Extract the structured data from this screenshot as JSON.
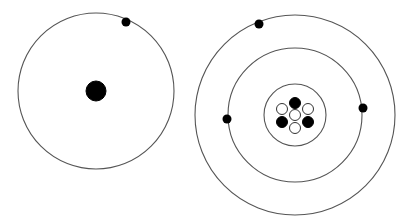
{
  "diagram": {
    "type": "bohr-atom-models",
    "colors": {
      "background": "#ffffff",
      "orbit": "#555555",
      "filled_particle": "#000000",
      "empty_particle": "#ffffff"
    },
    "atoms": [
      {
        "name": "hydrogen-like atom",
        "center": [
          96,
          91
        ],
        "nucleus": {
          "radius": 10,
          "particles": [
            {
              "type": "proton",
              "dx": 0,
              "dy": 0,
              "r": 10
            }
          ]
        },
        "orbits": [
          {
            "radius": 78
          }
        ],
        "electrons": [
          {
            "x": 126,
            "y": 22,
            "r": 4.5
          }
        ]
      },
      {
        "name": "multi-electron atom",
        "center": [
          295,
          115
        ],
        "nucleus": {
          "ring_radius": 31,
          "particles": [
            {
              "type": "proton",
              "dx": 0,
              "dy": -12,
              "r": 5.5
            },
            {
              "type": "neutron",
              "dx": -13,
              "dy": -6,
              "r": 5.5
            },
            {
              "type": "neutron",
              "dx": 13,
              "dy": -6,
              "r": 5.5
            },
            {
              "type": "neutron",
              "dx": 0,
              "dy": 0,
              "r": 5.5
            },
            {
              "type": "proton",
              "dx": -13,
              "dy": 7,
              "r": 5.5
            },
            {
              "type": "proton",
              "dx": 13,
              "dy": 7,
              "r": 5.5
            },
            {
              "type": "neutron",
              "dx": 0,
              "dy": 13,
              "r": 5.5
            }
          ]
        },
        "orbits": [
          {
            "radius": 67
          },
          {
            "radius": 100
          }
        ],
        "electrons": [
          {
            "x": 259,
            "y": 24,
            "r": 4.5
          },
          {
            "x": 363,
            "y": 108,
            "r": 4.5
          },
          {
            "x": 227,
            "y": 119,
            "r": 4.5
          }
        ]
      }
    ],
    "counts": {
      "left_electrons": 1,
      "right_electrons": 3,
      "right_protons": 3,
      "right_neutrons": 4
    }
  }
}
